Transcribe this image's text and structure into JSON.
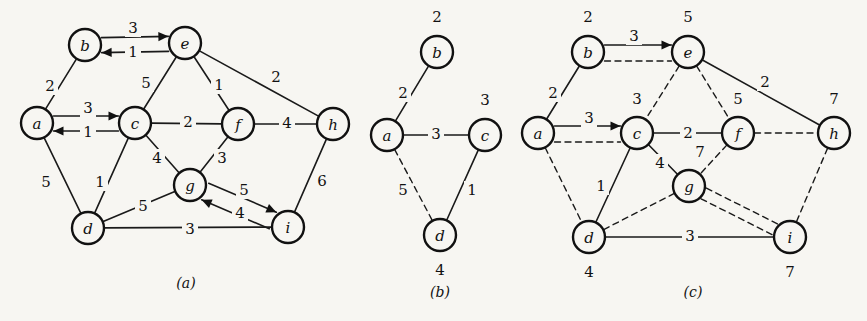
{
  "figure": {
    "background_color": "#f7f6f2",
    "ink_color": "#111111",
    "width": 867,
    "height": 321
  },
  "panels": [
    {
      "id": "a",
      "caption": "(a)",
      "caption_pos": {
        "x": 186,
        "y": 283
      },
      "nodes": [
        {
          "id": "b",
          "label": "b",
          "x": 85,
          "y": 45
        },
        {
          "id": "e",
          "label": "e",
          "x": 185,
          "y": 43
        },
        {
          "id": "a",
          "label": "a",
          "x": 37,
          "y": 123
        },
        {
          "id": "c",
          "label": "c",
          "x": 135,
          "y": 123
        },
        {
          "id": "f",
          "label": "f",
          "x": 238,
          "y": 124
        },
        {
          "id": "h",
          "label": "h",
          "x": 333,
          "y": 124
        },
        {
          "id": "g",
          "label": "g",
          "x": 190,
          "y": 185
        },
        {
          "id": "d",
          "label": "d",
          "x": 88,
          "y": 228
        },
        {
          "id": "i",
          "label": "i",
          "x": 288,
          "y": 227
        }
      ],
      "edges": [
        {
          "from": "b",
          "to": "a",
          "weight": "2",
          "style": "solid",
          "arrow": "none",
          "label_pos": {
            "x": 50,
            "y": 86
          }
        },
        {
          "from": "b",
          "to": "e",
          "weight": "3",
          "style": "solid",
          "arrow": "forward",
          "label_pos": {
            "x": 133,
            "y": 28
          },
          "offset": -7
        },
        {
          "from": "b",
          "to": "e",
          "weight": "1",
          "style": "solid",
          "arrow": "backward",
          "label_pos": {
            "x": 133,
            "y": 52
          },
          "offset": 8
        },
        {
          "from": "e",
          "to": "c",
          "weight": "5",
          "style": "solid",
          "arrow": "none",
          "label_pos": {
            "x": 146,
            "y": 83
          }
        },
        {
          "from": "e",
          "to": "f",
          "weight": "1",
          "style": "solid",
          "arrow": "none",
          "label_pos": {
            "x": 219,
            "y": 85
          }
        },
        {
          "from": "e",
          "to": "h",
          "weight": "2",
          "style": "solid",
          "arrow": "none",
          "label_pos": {
            "x": 276,
            "y": 77
          }
        },
        {
          "from": "a",
          "to": "c",
          "weight": "3",
          "style": "solid",
          "arrow": "forward",
          "label_pos": {
            "x": 88,
            "y": 108
          },
          "offset": -7
        },
        {
          "from": "a",
          "to": "c",
          "weight": "1",
          "style": "solid",
          "arrow": "backward",
          "label_pos": {
            "x": 88,
            "y": 132
          },
          "offset": 8
        },
        {
          "from": "a",
          "to": "d",
          "weight": "5",
          "style": "solid",
          "arrow": "none",
          "label_pos": {
            "x": 46,
            "y": 182
          }
        },
        {
          "from": "c",
          "to": "f",
          "weight": "2",
          "style": "solid",
          "arrow": "none",
          "label_pos": {
            "x": 188,
            "y": 122
          }
        },
        {
          "from": "c",
          "to": "g",
          "weight": "4",
          "style": "solid",
          "arrow": "none",
          "label_pos": {
            "x": 157,
            "y": 158
          }
        },
        {
          "from": "c",
          "to": "d",
          "weight": "1",
          "style": "solid",
          "arrow": "none",
          "label_pos": {
            "x": 100,
            "y": 182
          }
        },
        {
          "from": "f",
          "to": "g",
          "weight": "3",
          "style": "solid",
          "arrow": "none",
          "label_pos": {
            "x": 222,
            "y": 158
          }
        },
        {
          "from": "f",
          "to": "h",
          "weight": "4",
          "style": "solid",
          "arrow": "none",
          "label_pos": {
            "x": 287,
            "y": 123
          }
        },
        {
          "from": "h",
          "to": "i",
          "weight": "6",
          "style": "solid",
          "arrow": "none",
          "label_pos": {
            "x": 322,
            "y": 181
          }
        },
        {
          "from": "g",
          "to": "i",
          "weight": "5",
          "style": "solid",
          "arrow": "forward",
          "label_pos": {
            "x": 244,
            "y": 190
          },
          "offset": -9
        },
        {
          "from": "g",
          "to": "i",
          "weight": "4",
          "style": "solid",
          "arrow": "backward",
          "label_pos": {
            "x": 240,
            "y": 213
          },
          "offset": 9
        },
        {
          "from": "d",
          "to": "g",
          "weight": "5",
          "style": "solid",
          "arrow": "none",
          "label_pos": {
            "x": 143,
            "y": 206
          }
        },
        {
          "from": "d",
          "to": "i",
          "weight": "3",
          "style": "solid",
          "arrow": "none",
          "label_pos": {
            "x": 190,
            "y": 229
          }
        }
      ],
      "distances": []
    },
    {
      "id": "b",
      "caption": "(b)",
      "caption_pos": {
        "x": 440,
        "y": 292
      },
      "nodes": [
        {
          "id": "b",
          "label": "b",
          "x": 437,
          "y": 52
        },
        {
          "id": "a",
          "label": "a",
          "x": 387,
          "y": 135
        },
        {
          "id": "c",
          "label": "c",
          "x": 485,
          "y": 135
        },
        {
          "id": "d",
          "label": "d",
          "x": 440,
          "y": 235
        }
      ],
      "edges": [
        {
          "from": "a",
          "to": "b",
          "weight": "2",
          "style": "solid",
          "arrow": "none",
          "label_pos": {
            "x": 403,
            "y": 93
          }
        },
        {
          "from": "a",
          "to": "c",
          "weight": "3",
          "style": "solid",
          "arrow": "none",
          "label_pos": {
            "x": 436,
            "y": 134
          }
        },
        {
          "from": "a",
          "to": "d",
          "weight": "5",
          "style": "dashed",
          "arrow": "none",
          "label_pos": {
            "x": 403,
            "y": 190
          }
        },
        {
          "from": "c",
          "to": "d",
          "weight": "1",
          "style": "solid",
          "arrow": "none",
          "label_pos": {
            "x": 472,
            "y": 190
          }
        }
      ],
      "distances": [
        {
          "node": "b",
          "value": "2",
          "x": 437,
          "y": 17
        },
        {
          "node": "c",
          "value": "3",
          "x": 485,
          "y": 100
        },
        {
          "node": "d",
          "value": "4",
          "x": 440,
          "y": 270
        }
      ]
    },
    {
      "id": "c",
      "caption": "(c)",
      "caption_pos": {
        "x": 693,
        "y": 292
      },
      "nodes": [
        {
          "id": "b",
          "label": "b",
          "x": 588,
          "y": 52
        },
        {
          "id": "e",
          "label": "e",
          "x": 688,
          "y": 52
        },
        {
          "id": "a",
          "label": "a",
          "x": 538,
          "y": 133
        },
        {
          "id": "c",
          "label": "c",
          "x": 637,
          "y": 133
        },
        {
          "id": "f",
          "label": "f",
          "x": 738,
          "y": 133
        },
        {
          "id": "h",
          "label": "h",
          "x": 834,
          "y": 133
        },
        {
          "id": "g",
          "label": "g",
          "x": 689,
          "y": 186
        },
        {
          "id": "d",
          "label": "d",
          "x": 589,
          "y": 237
        },
        {
          "id": "i",
          "label": "i",
          "x": 790,
          "y": 237
        }
      ],
      "edges": [
        {
          "from": "a",
          "to": "b",
          "weight": "2",
          "style": "solid",
          "arrow": "none",
          "label_pos": {
            "x": 553,
            "y": 93
          }
        },
        {
          "from": "b",
          "to": "e",
          "weight": "3",
          "style": "solid",
          "arrow": "forward",
          "label_pos": {
            "x": 634,
            "y": 36
          },
          "offset": -7
        },
        {
          "from": "b",
          "to": "e",
          "weight": "",
          "style": "dashed",
          "arrow": "none",
          "label_pos": {
            "x": 0,
            "y": 0
          },
          "offset": 9
        },
        {
          "from": "a",
          "to": "c",
          "weight": "3",
          "style": "solid",
          "arrow": "forward",
          "label_pos": {
            "x": 589,
            "y": 118
          },
          "offset": -7
        },
        {
          "from": "a",
          "to": "c",
          "weight": "",
          "style": "dashed",
          "arrow": "none",
          "label_pos": {
            "x": 0,
            "y": 0
          },
          "offset": 9
        },
        {
          "from": "a",
          "to": "d",
          "weight": "",
          "style": "dashed",
          "arrow": "none",
          "label_pos": {
            "x": 0,
            "y": 0
          }
        },
        {
          "from": "e",
          "to": "c",
          "weight": "",
          "style": "dashed",
          "arrow": "none",
          "label_pos": {
            "x": 0,
            "y": 0
          }
        },
        {
          "from": "e",
          "to": "f",
          "weight": "",
          "style": "dashed",
          "arrow": "none",
          "label_pos": {
            "x": 0,
            "y": 0
          }
        },
        {
          "from": "e",
          "to": "h",
          "weight": "2",
          "style": "solid",
          "arrow": "none",
          "label_pos": {
            "x": 765,
            "y": 82
          }
        },
        {
          "from": "c",
          "to": "f",
          "weight": "2",
          "style": "solid",
          "arrow": "none",
          "label_pos": {
            "x": 688,
            "y": 133
          }
        },
        {
          "from": "c",
          "to": "g",
          "weight": "4",
          "style": "solid",
          "arrow": "none",
          "label_pos": {
            "x": 660,
            "y": 163
          }
        },
        {
          "from": "c",
          "to": "d",
          "weight": "1",
          "style": "solid",
          "arrow": "none",
          "label_pos": {
            "x": 601,
            "y": 186
          }
        },
        {
          "from": "f",
          "to": "g",
          "weight": "",
          "style": "dashed",
          "arrow": "none",
          "label_pos": {
            "x": 0,
            "y": 0
          }
        },
        {
          "from": "f",
          "to": "h",
          "weight": "",
          "style": "dashed",
          "arrow": "none",
          "label_pos": {
            "x": 0,
            "y": 0
          }
        },
        {
          "from": "h",
          "to": "i",
          "weight": "",
          "style": "dashed",
          "arrow": "none",
          "label_pos": {
            "x": 0,
            "y": 0
          }
        },
        {
          "from": "g",
          "to": "i",
          "weight": "",
          "style": "dashed",
          "arrow": "none",
          "label_pos": {
            "x": 0,
            "y": 0
          },
          "offset": -6
        },
        {
          "from": "g",
          "to": "i",
          "weight": "",
          "style": "dashed",
          "arrow": "none",
          "label_pos": {
            "x": 0,
            "y": 0
          },
          "offset": 6
        },
        {
          "from": "d",
          "to": "g",
          "weight": "",
          "style": "dashed",
          "arrow": "none",
          "label_pos": {
            "x": 0,
            "y": 0
          }
        },
        {
          "from": "d",
          "to": "i",
          "weight": "3",
          "style": "solid",
          "arrow": "none",
          "label_pos": {
            "x": 690,
            "y": 236
          }
        }
      ],
      "distances": [
        {
          "node": "b",
          "value": "2",
          "x": 588,
          "y": 17
        },
        {
          "node": "e",
          "value": "5",
          "x": 688,
          "y": 17
        },
        {
          "node": "c",
          "value": "3",
          "x": 637,
          "y": 99
        },
        {
          "node": "f",
          "value": "5",
          "x": 738,
          "y": 99
        },
        {
          "node": "h",
          "value": "7",
          "x": 834,
          "y": 99
        },
        {
          "node": "g",
          "value": "7",
          "x": 700,
          "y": 152
        },
        {
          "node": "d",
          "value": "4",
          "x": 589,
          "y": 272
        },
        {
          "node": "i",
          "value": "7",
          "x": 790,
          "y": 272
        }
      ]
    }
  ]
}
